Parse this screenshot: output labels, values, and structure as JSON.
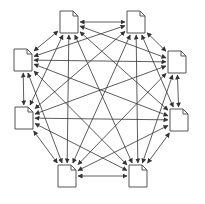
{
  "diagram": {
    "type": "complete-graph",
    "node_icon": "document-icon",
    "edge_style": "bidirectional-arrow",
    "stroke_color": "#333333",
    "nodes": [
      {
        "id": "n1",
        "x": 69,
        "y": 22
      },
      {
        "id": "n2",
        "x": 136,
        "y": 22
      },
      {
        "id": "n3",
        "x": 177,
        "y": 62
      },
      {
        "id": "n4",
        "x": 179,
        "y": 120
      },
      {
        "id": "n5",
        "x": 138,
        "y": 176
      },
      {
        "id": "n6",
        "x": 67,
        "y": 176
      },
      {
        "id": "n7",
        "x": 24,
        "y": 118
      },
      {
        "id": "n8",
        "x": 23,
        "y": 60
      }
    ]
  }
}
